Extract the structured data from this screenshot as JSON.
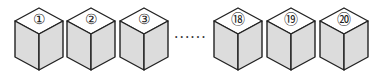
{
  "diagram": {
    "cubes": [
      {
        "label": "①",
        "number": 1,
        "x": 14
      },
      {
        "label": "②",
        "number": 2,
        "x": 66
      },
      {
        "label": "③",
        "number": 3,
        "x": 119
      },
      {
        "label": "⑱",
        "number": 18,
        "x": 213
      },
      {
        "label": "⑲",
        "number": 19,
        "x": 266
      },
      {
        "label": "⑳",
        "number": 20,
        "x": 319
      }
    ],
    "ellipsis": "······",
    "colors": {
      "top_face": "#ffffff",
      "side_faces": "#dcdcdc",
      "edges": "#222222"
    }
  }
}
